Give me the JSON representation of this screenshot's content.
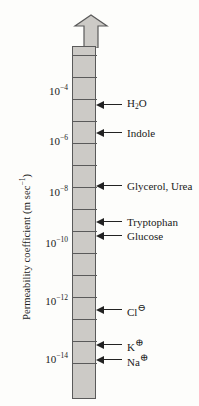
{
  "chart_data": {
    "type": "scatter",
    "title": "",
    "xlabel": "",
    "ylabel": "Permeability coefficient (m sec",
    "ylabel_exponent": "−1",
    "ylabel_suffix": ")",
    "scale": "log",
    "ylim": [
      1e-15,
      0.001
    ],
    "grid": false,
    "legend": "none",
    "axis_ticks": [
      {
        "label_mantissa": "10",
        "label_exponent": "−4",
        "value": 0.0001,
        "y": 90
      },
      {
        "label_mantissa": "10",
        "label_exponent": "−6",
        "value": 1e-06,
        "y": 140
      },
      {
        "label_mantissa": "10",
        "label_exponent": "−8",
        "value": 1e-08,
        "y": 191
      },
      {
        "label_mantissa": "10",
        "label_exponent": "−10",
        "value": 1e-10,
        "y": 242
      },
      {
        "label_mantissa": "10",
        "label_exponent": "−12",
        "value": 1e-12,
        "y": 300
      },
      {
        "label_mantissa": "10",
        "label_exponent": "−14",
        "value": 1e-14,
        "y": 358
      }
    ],
    "segment_lines_y": [
      54,
      76,
      98,
      120,
      142,
      164,
      186,
      208,
      230,
      252,
      274,
      296,
      318,
      340,
      362
    ],
    "data_points": [
      {
        "name": "H2O",
        "label_html": "H<sub>2</sub>O",
        "y": 105,
        "approx_value": 5e-05
      },
      {
        "name": "Indole",
        "label_html": "Indole",
        "y": 133,
        "approx_value": 4e-06
      },
      {
        "name": "Glycerol, Urea",
        "label_html": "Glycerol, Urea",
        "y": 186,
        "approx_value": 3e-08
      },
      {
        "name": "Tryptophan",
        "label_html": "Tryptophan",
        "y": 222,
        "approx_value": 1e-09
      },
      {
        "name": "Glucose",
        "label_html": "Glucose",
        "y": 236,
        "approx_value": 4e-10
      },
      {
        "name": "Chloride ion",
        "label_html": "Cl",
        "charge": "⊖",
        "y": 310,
        "approx_value": 1e-12
      },
      {
        "name": "Potassium ion",
        "label_html": "K",
        "charge": "⊕",
        "y": 345,
        "approx_value": 5e-14
      },
      {
        "name": "Sodium ion",
        "label_html": "Na",
        "charge": "⊕",
        "y": 360,
        "approx_value": 1e-14
      }
    ]
  },
  "colors": {
    "bar_fill": "#cccac6",
    "bar_stroke": "#5a5a5a",
    "text": "#1a1a1a",
    "background": "#fdfdfb"
  }
}
